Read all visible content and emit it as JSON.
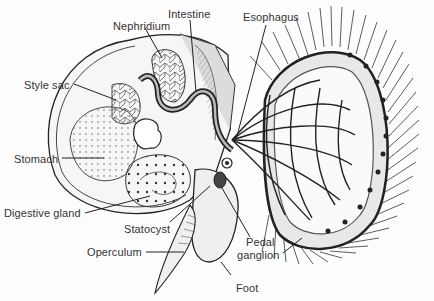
{
  "diagram": {
    "type": "anatomical-illustration",
    "labels": [
      {
        "id": "nephridium",
        "text": "Nephridium",
        "x": 113,
        "y": 20
      },
      {
        "id": "intestine",
        "text": "Intestine",
        "x": 168,
        "y": 8
      },
      {
        "id": "esophagus",
        "text": "Esophagus",
        "x": 243,
        "y": 11
      },
      {
        "id": "style_sac",
        "text": "Style sac",
        "x": 24,
        "y": 79
      },
      {
        "id": "stomach",
        "text": "Stomach",
        "x": 14,
        "y": 153
      },
      {
        "id": "digestive_gland",
        "text": "Digestive gland",
        "x": 4,
        "y": 207
      },
      {
        "id": "statocyst",
        "text": "Statocyst",
        "x": 124,
        "y": 223
      },
      {
        "id": "operculum",
        "text": "Operculum",
        "x": 87,
        "y": 246
      },
      {
        "id": "pedal_ganglion_1",
        "text": "Pedal",
        "x": 246,
        "y": 236
      },
      {
        "id": "pedal_ganglion_2",
        "text": "ganglion",
        "x": 237,
        "y": 249
      },
      {
        "id": "foot",
        "text": "Foot",
        "x": 236,
        "y": 282
      }
    ],
    "colors": {
      "ink": "#222222",
      "label_text": "#333333",
      "background": "#fdfdfd",
      "shading": "#cfcfcf"
    }
  }
}
